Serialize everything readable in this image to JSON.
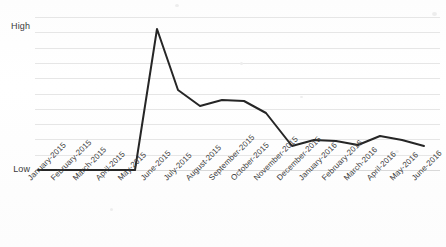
{
  "chart_data": {
    "type": "line",
    "title": "",
    "subtitle": "",
    "xlabel": "",
    "ylabel": "",
    "grid": true,
    "legend": "none",
    "categories": [
      "January-2015",
      "February-2015",
      "March-2015",
      "April-2015",
      "May-2015",
      "June-2015",
      "July-2015",
      "August-2015",
      "September-2015",
      "October-2015",
      "November-2015",
      "December-2015",
      "January-2016",
      "February-2016",
      "March-2016",
      "April-2016",
      "May-2016",
      "June-2016"
    ],
    "y_tick_labels": [
      "High",
      "Low"
    ],
    "ylim_labels": {
      "max": "High",
      "min": "Low"
    },
    "gridline_count": 11,
    "series": [
      {
        "name": "trend",
        "color": "#262626",
        "values": [
          0.02,
          0.02,
          0.02,
          0.02,
          0.02,
          1.0,
          0.57,
          0.45,
          0.49,
          0.48,
          0.4,
          0.17,
          0.21,
          0.2,
          0.17,
          0.23,
          0.2,
          0.17
        ]
      }
    ],
    "points_px": [
      {
        "x": 38,
        "y": 170
      },
      {
        "x": 57,
        "y": 170
      },
      {
        "x": 76,
        "y": 170
      },
      {
        "x": 96,
        "y": 170
      },
      {
        "x": 135,
        "y": 170
      },
      {
        "x": 157,
        "y": 29
      },
      {
        "x": 178,
        "y": 90
      },
      {
        "x": 200,
        "y": 106
      },
      {
        "x": 222,
        "y": 100
      },
      {
        "x": 244,
        "y": 101
      },
      {
        "x": 266,
        "y": 113
      },
      {
        "x": 292,
        "y": 146
      },
      {
        "x": 314,
        "y": 140
      },
      {
        "x": 336,
        "y": 141
      },
      {
        "x": 358,
        "y": 145
      },
      {
        "x": 380,
        "y": 136
      },
      {
        "x": 402,
        "y": 140
      },
      {
        "x": 424,
        "y": 146
      }
    ],
    "colors": {
      "line": "#262626",
      "gridline": "#e6e6e6",
      "text": "#3a3a3a",
      "background": "#ffffff"
    }
  }
}
